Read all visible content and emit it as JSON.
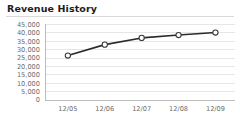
{
  "panel": {
    "title": "Revenue History"
  },
  "chart_data": {
    "type": "line",
    "title": "Revenue History",
    "xlabel": "",
    "ylabel": "",
    "categories": [
      "12/05",
      "12/06",
      "12/07",
      "12/08",
      "12/09"
    ],
    "series": [
      {
        "name": "Revenue",
        "values": [
          26500,
          33000,
          37000,
          38700,
          40200
        ]
      }
    ],
    "ylim": [
      0,
      45000
    ],
    "ytick_values": [
      0,
      5000,
      10000,
      15000,
      20000,
      25000,
      30000,
      35000,
      40000,
      45000
    ],
    "ytick_labels": [
      "0",
      "5,000",
      "10,000",
      "15,000",
      "20,000",
      "25,000",
      "30,000",
      "35,000",
      "40,000",
      "45,000"
    ],
    "xtick_labels": [
      "12/05",
      "12/06",
      "12/07",
      "12/08",
      "12/09"
    ],
    "grid": true,
    "grid_axis": "y",
    "legend": false,
    "legend_position": "none",
    "marker": "circle-open",
    "colors": {
      "line": "#2b2b2b",
      "marker_fill": "#ffffff",
      "marker_stroke": "#3a3a3a",
      "grid": "#e6e6e6",
      "axis": "#bdbdbd",
      "tick_text": "#6b6b6b",
      "title_text": "#1c1c1c",
      "background": "#ffffff"
    }
  }
}
